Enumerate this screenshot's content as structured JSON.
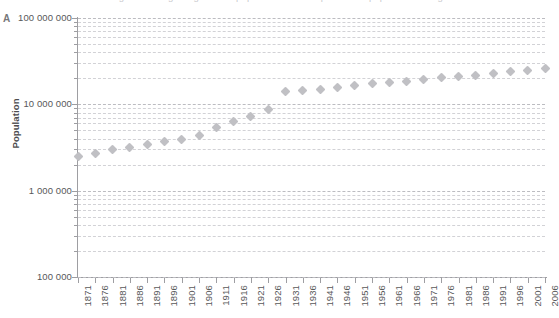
{
  "figure": {
    "panel_letter": "A",
    "cut_off_title": "Figure 1. Long-run growth of population and components of population change",
    "marker_color": "#c0c0c4",
    "axis_color": "#9e9ea2",
    "gridline_color": "#d2d2d6"
  },
  "chart_data": {
    "type": "scatter",
    "title": "",
    "xlabel": "",
    "ylabel": "Population",
    "yscale": "log",
    "ylim": [
      100000,
      100000000
    ],
    "grid": true,
    "legend": "none",
    "ytick_labels": [
      "100 000 000",
      "10 000 000",
      "1 000 000",
      "100 000"
    ],
    "ytick_values": [
      100000000,
      10000000,
      1000000,
      100000
    ],
    "minor_gridlines": true,
    "categories": [
      "1871",
      "1876",
      "1881",
      "1886",
      "1891",
      "1896",
      "1901",
      "1906",
      "1911",
      "1916",
      "1921",
      "1926",
      "1931",
      "1936",
      "1941",
      "1946",
      "1951",
      "1956",
      "1961",
      "1966",
      "1971",
      "1976",
      "1981",
      "1986",
      "1991",
      "1996",
      "2001",
      "2006"
    ],
    "x": [
      1871,
      1876,
      1881,
      1886,
      1891,
      1896,
      1901,
      1906,
      1911,
      1916,
      1921,
      1926,
      1931,
      1936,
      1941,
      1946,
      1951,
      1956,
      1961,
      1966,
      1971,
      1976,
      1981,
      1986,
      1991,
      1996,
      2001,
      2006
    ],
    "values": [
      2500000,
      2720000,
      2980000,
      3180000,
      3420000,
      3700000,
      3960000,
      4300000,
      5400000,
      6300000,
      7200000,
      8800000,
      14000000,
      14400000,
      14900000,
      15700000,
      16500000,
      17200000,
      17900000,
      18600000,
      19400000,
      20300000,
      21100000,
      21800000,
      22800000,
      23700000,
      24700000,
      26000000
    ],
    "annotations": []
  }
}
